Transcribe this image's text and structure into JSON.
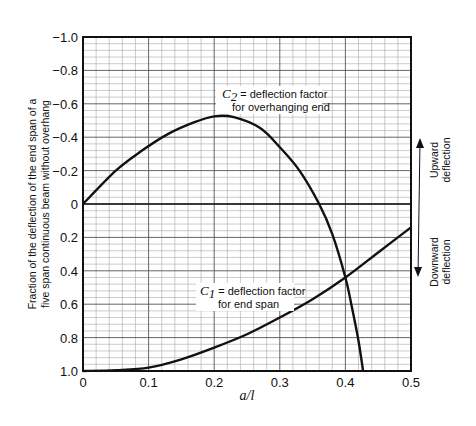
{
  "chart_data": {
    "type": "line",
    "title": "",
    "xlabel": "a/l",
    "ylabel": "Fraction of the deflection of the end span of a five span continuous beam without overhang",
    "ylabel_lines": [
      "Fraction of the deflection of the end span of a",
      "five span continuous beam without overhang"
    ],
    "xlim": [
      0,
      0.5
    ],
    "ylim": [
      -1.0,
      1.0
    ],
    "y_inverted": true,
    "x_ticks": [
      "0",
      "0.1",
      "0.2",
      "0.3",
      "0.4",
      "0.5"
    ],
    "y_ticks": [
      "-1.0",
      "-0.8",
      "-0.6",
      "-0.4",
      "-0.2",
      "0",
      "0.2",
      "0.4",
      "0.6",
      "0.8",
      "1.0"
    ],
    "grid": true,
    "series": [
      {
        "name": "C2 = deflection factor for overhanging end",
        "x": [
          0,
          0.05,
          0.09,
          0.13,
          0.17,
          0.2,
          0.23,
          0.27,
          0.3,
          0.33,
          0.36,
          0.38,
          0.4,
          0.41,
          0.42,
          0.427
        ],
        "y": [
          0,
          -0.2,
          -0.32,
          -0.42,
          -0.49,
          -0.525,
          -0.52,
          -0.455,
          -0.34,
          -0.2,
          0,
          0.18,
          0.44,
          0.62,
          0.82,
          1.0
        ]
      },
      {
        "name": "C1 = deflection factor for end span",
        "x": [
          0,
          0.05,
          0.1,
          0.15,
          0.2,
          0.25,
          0.3,
          0.35,
          0.4,
          0.45,
          0.5
        ],
        "y": [
          1.0,
          0.995,
          0.98,
          0.93,
          0.86,
          0.78,
          0.68,
          0.57,
          0.44,
          0.29,
          0.14
        ]
      }
    ],
    "annotations": {
      "c2": {
        "symbol": "C",
        "sub": "2",
        "line1": " = deflection factor",
        "line2": "for overhanging end"
      },
      "c1": {
        "symbol": "C",
        "sub": "1",
        "line1": " = deflection factor",
        "line2": "for end span"
      },
      "upward": [
        "Upward",
        "deflection"
      ],
      "downward": [
        "Downward",
        "deflection"
      ]
    }
  }
}
